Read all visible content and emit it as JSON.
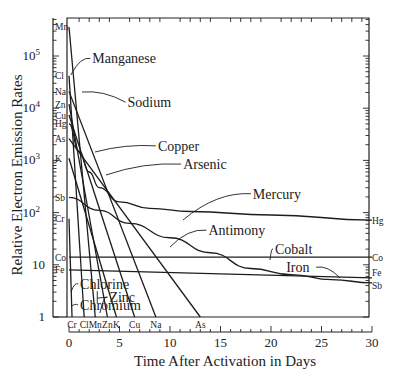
{
  "chart_data": {
    "type": "line",
    "title": "",
    "xlabel": "Time After Activation in Days",
    "ylabel": "Relative Electron Emission Rates",
    "xlim": [
      0,
      30
    ],
    "ylim": [
      1,
      540000
    ],
    "yscale": "log",
    "grid": false,
    "x_ticks": [
      0,
      5,
      10,
      15,
      20,
      25,
      30
    ],
    "y_ticks": [
      {
        "value": 1,
        "label": "1"
      },
      {
        "value": 10,
        "label": "10"
      },
      {
        "value": 100,
        "label": "10",
        "sup": "2"
      },
      {
        "value": 1000,
        "label": "10",
        "sup": "3"
      },
      {
        "value": 10000,
        "label": "10",
        "sup": "4"
      },
      {
        "value": 100000,
        "label": "10",
        "sup": "5"
      }
    ],
    "left_axis_labels": [
      "Mn",
      "Cl",
      "Na",
      "Zn",
      "Cu",
      "Hg",
      "As",
      "K",
      "Sb",
      "Cr",
      "Co",
      "Fe"
    ],
    "bottom_axis_labels": [
      "Cr",
      "Cl",
      "Mn",
      "Zn",
      "K",
      "Cu",
      "Na",
      "As"
    ],
    "right_axis_labels": [
      "Hg",
      "Co",
      "Fe",
      "Sb"
    ],
    "series": [
      {
        "name": "Manganese",
        "symbol": "Mn",
        "x": [
          0,
          2.6
        ],
        "y": [
          360000,
          1
        ]
      },
      {
        "name": "Chlorine",
        "symbol": "Cl",
        "x": [
          0,
          1.5
        ],
        "y": [
          42000,
          1
        ]
      },
      {
        "name": "Sodium",
        "symbol": "Na",
        "x": [
          0,
          8.6
        ],
        "y": [
          21000,
          1
        ]
      },
      {
        "name": "Zinc",
        "symbol": "Zn",
        "x": [
          0,
          3.8
        ],
        "y": [
          12000,
          1
        ]
      },
      {
        "name": "Copper",
        "symbol": "Cu",
        "x": [
          0,
          6.5
        ],
        "y": [
          7400,
          1
        ]
      },
      {
        "name": "Mercury",
        "symbol": "Hg",
        "x": [
          0,
          1,
          2,
          3,
          5,
          8,
          12,
          20,
          30
        ],
        "y": [
          5000,
          1500,
          600,
          300,
          160,
          120,
          105,
          90,
          72
        ]
      },
      {
        "name": "Arsenic",
        "symbol": "As",
        "x": [
          0,
          13
        ],
        "y": [
          2600,
          1
        ]
      },
      {
        "name": "Potassium",
        "symbol": "K",
        "x": [
          0,
          4.7
        ],
        "y": [
          1100,
          1
        ]
      },
      {
        "name": "Antimony",
        "symbol": "Sb",
        "x": [
          0,
          3,
          6,
          10,
          14,
          18,
          22,
          26,
          30
        ],
        "y": [
          195,
          110,
          62,
          33,
          17,
          8.5,
          6.5,
          5.2,
          4.5
        ]
      },
      {
        "name": "Chromium",
        "symbol": "Cr",
        "x": [
          0,
          0.3
        ],
        "y": [
          76,
          1
        ]
      },
      {
        "name": "Cobalt",
        "symbol": "Co",
        "x": [
          0,
          30
        ],
        "y": [
          14,
          14
        ]
      },
      {
        "name": "Iron",
        "symbol": "Fe",
        "x": [
          0,
          30
        ],
        "y": [
          8,
          5.6
        ]
      }
    ],
    "annotations": [
      {
        "text": "Manganese",
        "x": 2.3,
        "y": 90000
      },
      {
        "text": "Sodium",
        "x": 5.8,
        "y": 13000
      },
      {
        "text": "Copper",
        "x": 8.8,
        "y": 1900
      },
      {
        "text": "Arsenic",
        "x": 11.3,
        "y": 850
      },
      {
        "text": "Mercury",
        "x": 18.2,
        "y": 230
      },
      {
        "text": "Antimony",
        "x": 13.8,
        "y": 46
      },
      {
        "text": "Cobalt",
        "x": 20.4,
        "y": 20
      },
      {
        "text": "Iron",
        "x": 21.5,
        "y": 9
      },
      {
        "text": "Chlorine",
        "x": 1.1,
        "y": 4.3
      },
      {
        "text": "Zinc",
        "x": 4.0,
        "y": 2.4
      },
      {
        "text": "Chromium",
        "x": 1.1,
        "y": 1.7
      }
    ]
  }
}
